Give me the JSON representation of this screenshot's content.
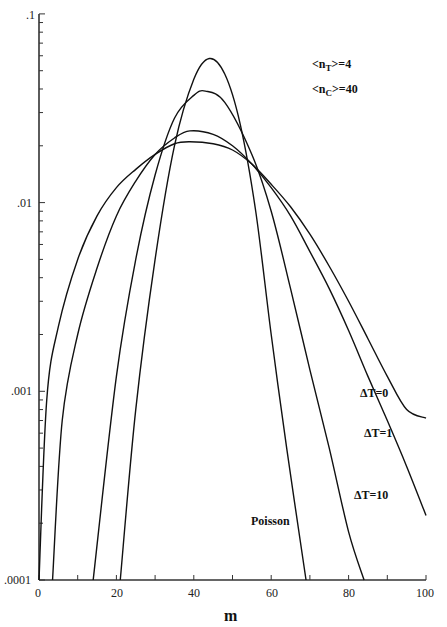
{
  "chart_data": {
    "type": "line",
    "title": "",
    "xlabel": "m",
    "ylabel": "",
    "xlim": [
      0,
      100
    ],
    "ylim": [
      0.0001,
      0.1
    ],
    "yscale": "log",
    "grid": false,
    "x_ticks": [
      "0",
      "20",
      "40",
      "60",
      "80",
      "100"
    ],
    "y_ticks": [
      ".0001",
      ".001",
      ".01",
      ".1"
    ],
    "annotations": [
      "<n_T>=4",
      "<n_C>=40"
    ],
    "legend": "inline labels",
    "series": [
      {
        "name": "Poisson",
        "x": [
          21,
          25,
          30,
          35,
          40,
          44,
          48,
          52,
          56,
          60,
          64,
          69
        ],
        "values": [
          0.0001,
          0.0008,
          0.005,
          0.02,
          0.045,
          0.058,
          0.048,
          0.026,
          0.009,
          0.002,
          0.0005,
          0.0001
        ]
      },
      {
        "name": "ΔT=10",
        "x": [
          14,
          20,
          25,
          30,
          35,
          40,
          43,
          48,
          55,
          60,
          65,
          70,
          75,
          80,
          84
        ],
        "values": [
          0.0001,
          0.0012,
          0.005,
          0.014,
          0.028,
          0.037,
          0.039,
          0.034,
          0.018,
          0.009,
          0.0035,
          0.0013,
          0.0005,
          0.00018,
          0.0001
        ]
      },
      {
        "name": "ΔT=1",
        "x": [
          3.5,
          6,
          10,
          15,
          20,
          25,
          30,
          35,
          39,
          45,
          50,
          55,
          60,
          65,
          70,
          75,
          80,
          85,
          90,
          95,
          100
        ],
        "values": [
          0.0001,
          0.0007,
          0.002,
          0.0045,
          0.0085,
          0.013,
          0.018,
          0.022,
          0.024,
          0.023,
          0.02,
          0.016,
          0.012,
          0.0085,
          0.0055,
          0.0035,
          0.0021,
          0.0012,
          0.0007,
          0.0004,
          0.00022
        ]
      },
      {
        "name": "ΔT=0",
        "x": [
          0,
          2,
          5,
          10,
          15,
          20,
          25,
          30,
          35,
          39,
          45,
          50,
          55,
          60,
          65,
          70,
          75,
          80,
          85,
          90,
          95,
          100
        ],
        "values": [
          0.0001,
          0.0009,
          0.0022,
          0.005,
          0.0085,
          0.012,
          0.015,
          0.018,
          0.0205,
          0.021,
          0.0205,
          0.019,
          0.016,
          0.0125,
          0.0095,
          0.0068,
          0.0046,
          0.003,
          0.0019,
          0.0012,
          0.0008,
          0.00072
        ]
      }
    ],
    "labels": {
      "poisson": "Poisson",
      "dt10": "ΔT=10",
      "dt1": "ΔT=1",
      "dt0": "ΔT=0",
      "nT_prefix": "<n",
      "nT_sub": "T",
      "nT_suffix": ">=4",
      "nC_prefix": "<n",
      "nC_sub": "C",
      "nC_suffix": ">=40"
    }
  }
}
